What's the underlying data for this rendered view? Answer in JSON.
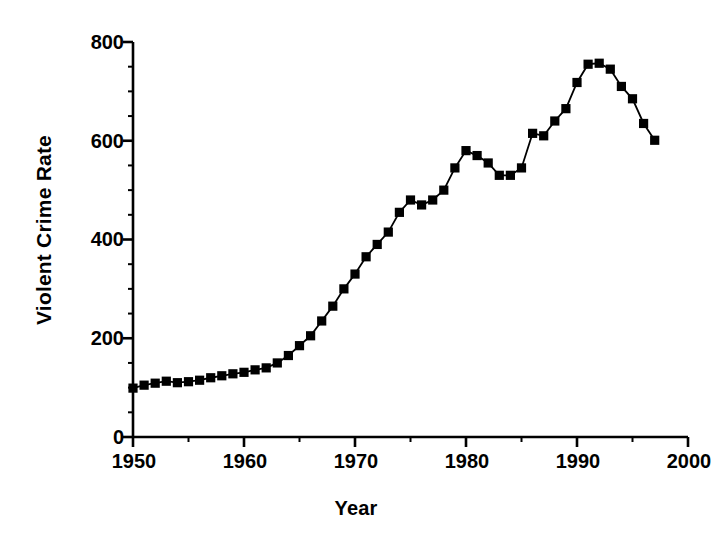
{
  "chart_data": {
    "type": "line",
    "title": "",
    "xlabel": "Year",
    "ylabel": "Violent Crime Rate",
    "xlim": [
      1950,
      2000
    ],
    "ylim": [
      0,
      800
    ],
    "xticks": [
      1950,
      1960,
      1970,
      1980,
      1990,
      2000
    ],
    "xtick_labels": [
      "1950",
      "1960",
      "1970",
      "1980",
      "1990",
      "2000"
    ],
    "yticks": [
      0,
      200,
      400,
      600,
      800
    ],
    "ytick_labels": [
      "0",
      "200",
      "400",
      "600",
      "800"
    ],
    "y_minor_tick_step": 50,
    "x_minor_tick_step": 5,
    "grid": false,
    "legend": null,
    "marker": "square",
    "marker_color": "#000000",
    "line_color": "#000000",
    "series": [
      {
        "name": "Violent Crime Rate",
        "x": [
          1950,
          1951,
          1952,
          1953,
          1954,
          1955,
          1956,
          1957,
          1958,
          1959,
          1960,
          1961,
          1962,
          1963,
          1964,
          1965,
          1966,
          1967,
          1968,
          1969,
          1970,
          1971,
          1972,
          1973,
          1974,
          1975,
          1976,
          1977,
          1978,
          1979,
          1980,
          1981,
          1982,
          1983,
          1984,
          1985,
          1986,
          1987,
          1988,
          1989,
          1990,
          1991,
          1992,
          1993,
          1994,
          1995,
          1996,
          1997
        ],
        "values": [
          99,
          105,
          109,
          113,
          110,
          112,
          115,
          120,
          124,
          128,
          131,
          136,
          140,
          150,
          165,
          185,
          205,
          235,
          265,
          300,
          330,
          365,
          390,
          415,
          455,
          480,
          470,
          480,
          500,
          545,
          580,
          570,
          555,
          530,
          530,
          545,
          615,
          610,
          640,
          665,
          718,
          755,
          757,
          745,
          710,
          685,
          635,
          601
        ]
      }
    ]
  }
}
